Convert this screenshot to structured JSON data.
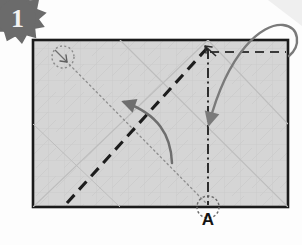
{
  "figure": {
    "step_number": "1",
    "type": "origami-fold-diagram",
    "background_color": "#fdfdfd"
  },
  "sheet": {
    "label": "paper-sheet",
    "fill_color": "#d5d5d5",
    "border_color": "#1a1a1a",
    "x": 33,
    "y": 40,
    "width": 255,
    "height": 167,
    "grid_color": "#c6c6c6",
    "grid_spacing": 16
  },
  "markers": {
    "point_a_label": "A",
    "point_a_x": 208,
    "point_a_y": 207,
    "target_circle_x": 62,
    "target_circle_y": 57,
    "circle_radius": 11,
    "circle_color": "#8a8a8a"
  },
  "creases": [
    {
      "name": "valley-fold-diagonal",
      "style": "dashed",
      "color": "#1d1d1d",
      "from_x": 67,
      "from_y": 203,
      "to_x": 208,
      "to_y": 47
    },
    {
      "name": "fold-edge-horizontal",
      "style": "dashed",
      "color": "#3a3a3a",
      "from_x": 210,
      "from_y": 52,
      "to_x": 287,
      "to_y": 52
    },
    {
      "name": "center-axis-vertical",
      "style": "dash-dot",
      "color": "#2a2a2a",
      "from_x": 208,
      "from_y": 50,
      "to_x": 208,
      "to_y": 205
    },
    {
      "name": "movement-guide-dotted",
      "style": "dotted",
      "color": "#8d8d8d",
      "from_x": 66,
      "from_y": 61,
      "to_x": 206,
      "to_y": 203
    }
  ],
  "arrows": [
    {
      "name": "fold-arrow-left",
      "color": "#6e6e6e",
      "direction": "up-left",
      "description": "curved arrow sweeping up and to the left across the valley fold"
    },
    {
      "name": "fold-arrow-corner",
      "color": "#7a7a7a",
      "direction": "down-into-sheet",
      "description": "curved arrow looping over the top-right corner down into the sheet"
    }
  ],
  "badge": {
    "name": "step-number-badge",
    "color": "#6b6b6b",
    "text": "1"
  }
}
